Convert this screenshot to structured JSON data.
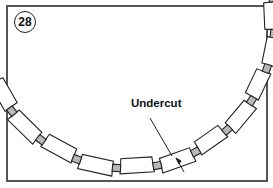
{
  "figure": {
    "number": "28",
    "callout_label": "Undercut"
  },
  "diagram": {
    "colors": {
      "frame": "#555555",
      "stroke": "#222222",
      "spacer_fill": "#b8b8b8",
      "background": "#ffffff"
    }
  }
}
